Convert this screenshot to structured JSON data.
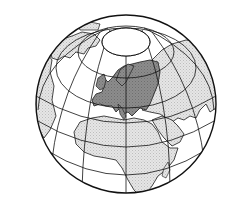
{
  "map": {
    "title": "Globe projection highlighting Europe",
    "projection": "orthographic",
    "center": {
      "x": 126,
      "y": 104
    },
    "radius": 90,
    "highlighted_region": "Europe",
    "colors": {
      "background": "#ffffff",
      "ocean": "#ffffff",
      "land": "#e3e3e3",
      "highlight": "#8a8a8a",
      "graticule": "#111111",
      "coastline": "#1a1a1a"
    },
    "regions": [
      {
        "name": "Europe",
        "fill": "highlight"
      },
      {
        "name": "Asia",
        "fill": "land"
      },
      {
        "name": "Africa",
        "fill": "land"
      },
      {
        "name": "Arabian Peninsula",
        "fill": "land"
      },
      {
        "name": "Greenland",
        "fill": "land"
      },
      {
        "name": "North America",
        "fill": "land"
      },
      {
        "name": "Madagascar",
        "fill": "land"
      }
    ],
    "features": {
      "polar_cap": true,
      "graticule": true
    }
  }
}
